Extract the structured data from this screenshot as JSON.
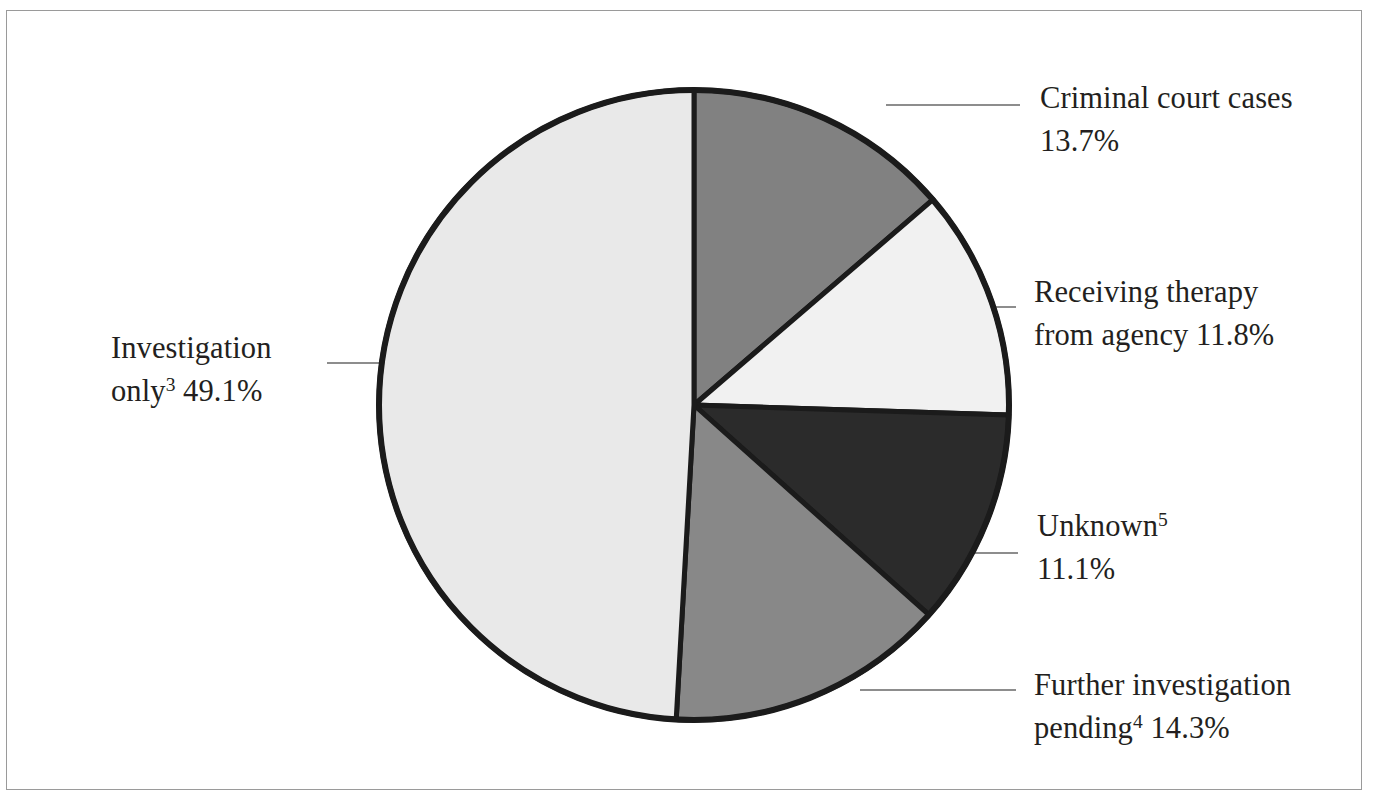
{
  "figure": {
    "background_color": "#ffffff",
    "frame_color": "#9a9a9a",
    "text_color": "#231f20"
  },
  "chart_data": {
    "type": "pie",
    "title": "",
    "subtitle": "",
    "xlabel": "",
    "ylabel": "",
    "legend_position": "callout-labels",
    "grid": false,
    "start_angle_deg": 0,
    "direction": "clockwise",
    "units": "percent",
    "categories": [
      "Criminal court cases",
      "Receiving therapy from agency",
      "Unknown",
      "Further investigation pending",
      "Investigation only"
    ],
    "values": [
      13.7,
      11.8,
      11.1,
      14.3,
      49.1
    ],
    "slices": [
      {
        "name": "criminal-court-cases",
        "label": "Criminal court cases",
        "value": 13.7,
        "value_text": "13.7%",
        "footnote": "",
        "color": "#818181",
        "start_deg": 0,
        "end_deg": 49.3
      },
      {
        "name": "receiving-therapy-from-agency",
        "label": "Receiving therapy from agency",
        "value": 11.8,
        "value_text": "11.8%",
        "footnote": "",
        "color": "#f1f1f1",
        "start_deg": 49.3,
        "end_deg": 91.8
      },
      {
        "name": "unknown",
        "label": "Unknown",
        "value": 11.1,
        "value_text": "11.1%",
        "footnote": "5",
        "color": "#2b2b2b",
        "start_deg": 91.8,
        "end_deg": 131.8
      },
      {
        "name": "further-investigation-pending",
        "label": "Further investigation pending",
        "value": 14.3,
        "value_text": "14.3%",
        "footnote": "4",
        "color": "#888888",
        "start_deg": 131.8,
        "end_deg": 183.3
      },
      {
        "name": "investigation-only",
        "label": "Investigation only",
        "value": 49.1,
        "value_text": "49.1%",
        "footnote": "3",
        "color": "#e9e9e9",
        "start_deg": 183.3,
        "end_deg": 360
      }
    ]
  },
  "labels": {
    "criminal": {
      "line1": "Criminal court cases",
      "line2": "13.7%"
    },
    "therapy": {
      "line1": "Receiving therapy",
      "line2": "from agency 11.8%"
    },
    "unknown": {
      "line1": "Unknown",
      "footnote": "5",
      "line2": "11.1%"
    },
    "further": {
      "line1": "Further investigation",
      "line2_prefix": "pending",
      "footnote": "4",
      "line2_suffix": " 14.3%"
    },
    "investigation": {
      "line1": "Investigation",
      "line2_prefix": "only",
      "footnote": "3",
      "line2_suffix": " 49.1%"
    }
  }
}
